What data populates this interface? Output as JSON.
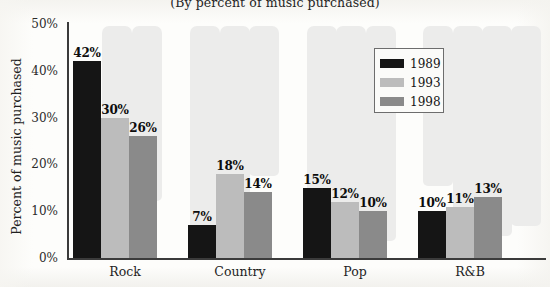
{
  "subtitle": "(By percent of music purchased)",
  "axes": {
    "y_title": "Percent of music purchased",
    "y_ticks": [
      "0%",
      "10%",
      "20%",
      "30%",
      "40%",
      "50%"
    ]
  },
  "legend": {
    "entries": [
      {
        "label": "1989",
        "color": "#151515"
      },
      {
        "label": "1993",
        "color": "#bcbcbc"
      },
      {
        "label": "1998",
        "color": "#8a8a8a"
      }
    ]
  },
  "bar_labels": {
    "rock": [
      "42%",
      "30%",
      "26%"
    ],
    "country": [
      "7%",
      "18%",
      "14%"
    ],
    "pop": [
      "15%",
      "12%",
      "10%"
    ],
    "rnb": [
      "10%",
      "11%",
      "13%"
    ]
  },
  "categories_display": [
    "Rock",
    "Country",
    "Pop",
    "R&B"
  ],
  "chart_data": {
    "type": "bar",
    "title": "",
    "subtitle": "(By percent of music purchased)",
    "xlabel": "",
    "ylabel": "Percent of music purchased",
    "ylim": [
      0,
      50
    ],
    "ytick_values": [
      0,
      10,
      20,
      30,
      40,
      50
    ],
    "ytick_labels": [
      "0%",
      "10%",
      "20%",
      "30%",
      "40%",
      "50%"
    ],
    "grid": false,
    "legend_position": "upper right inside plot",
    "categories": [
      "Rock",
      "Country",
      "Pop",
      "R&B"
    ],
    "series": [
      {
        "name": "1989",
        "color": "#151515",
        "values": [
          42,
          7,
          15,
          10
        ]
      },
      {
        "name": "1993",
        "color": "#bcbcbc",
        "values": [
          30,
          18,
          12,
          11
        ]
      },
      {
        "name": "1998",
        "color": "#8a8a8a",
        "values": [
          26,
          14,
          10,
          13
        ]
      }
    ],
    "data_labels": [
      [
        "42%",
        "30%",
        "26%"
      ],
      [
        "7%",
        "18%",
        "14%"
      ],
      [
        "15%",
        "12%",
        "10%"
      ],
      [
        "10%",
        "11%",
        "13%"
      ]
    ]
  }
}
